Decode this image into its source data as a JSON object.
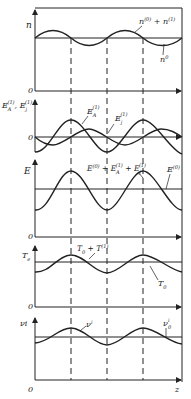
{
  "figure": {
    "x_axis_label": "z",
    "origin_label": "0",
    "stroke_color": "#222222",
    "panels": [
      {
        "id": "density",
        "y_label": "n",
        "zero_label": "0",
        "curve_labels": [
          "n^(0) + n^(1)",
          "n^0"
        ],
        "label_a": "n",
        "label_a_sup": "(0)",
        "label_a_plus": " + n",
        "label_a_sup2": "(1)",
        "label_b": "n",
        "label_b_sup": "0"
      },
      {
        "id": "fields",
        "y_label": "E_A^(1), E_j^(1)",
        "y_label_main": "E",
        "y_label_sub1": "A",
        "y_label_sup1": "(1)",
        "y_label_mid": ", E",
        "y_label_sub2": "j",
        "y_label_sup2": "(1)",
        "zero_label": "0",
        "curve_EA": "E",
        "curve_EA_sub": "A",
        "curve_EA_sup": "(1)",
        "curve_Ej": "E",
        "curve_Ej_sub": "j",
        "curve_Ej_sup": "(1)"
      },
      {
        "id": "total-field",
        "y_label": "E",
        "zero_label": "0",
        "sum_label": "E^(0) + E_A^(1) + E_j^(1)",
        "sum_E": "E",
        "sum_sup0": "(0)",
        "sum_plus1": " + E",
        "sum_subA": "A",
        "sum_supA": "(1)",
        "sum_plus2": " + E",
        "sum_subj": "j",
        "sum_supj": "(1)",
        "const_label": "E",
        "const_sup": "(0)"
      },
      {
        "id": "temperature",
        "y_label": "T",
        "y_label_sub": "e",
        "zero_label": "0",
        "pert_label": "T",
        "pert_sub": "0",
        "pert_plus": " + T",
        "pert_sup": "(1)",
        "base_label": "T",
        "base_sub": "0"
      },
      {
        "id": "ionization",
        "y_label": "νi",
        "zero_label": "0",
        "pert_label": "ν",
        "pert_sup": "i",
        "base_label": "ν",
        "base_sub": "0",
        "base_sup": "i"
      }
    ]
  }
}
